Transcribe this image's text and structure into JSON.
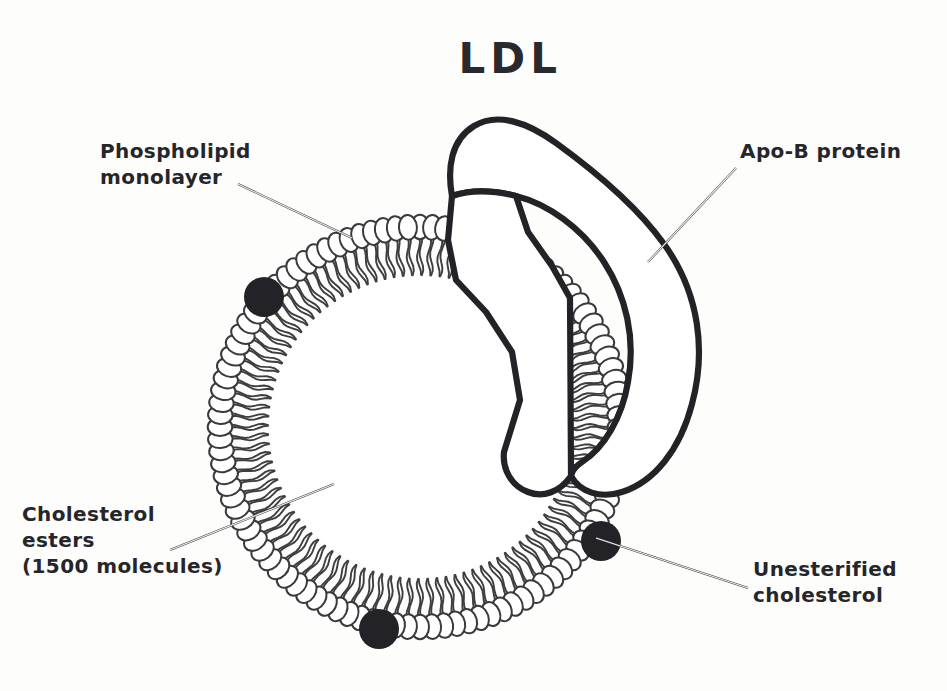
{
  "figure": {
    "title": "LDL",
    "background_color": "#fdfdfc",
    "ink_color": "#232327"
  },
  "labels": {
    "phospholipid": {
      "line1": "Phospholipid",
      "line2": "monolayer",
      "x": 100,
      "y": 143
    },
    "apob": {
      "line1": "Apo-B protein",
      "x": 740,
      "y": 143
    },
    "cholesterol_esters": {
      "line1": "Cholesterol",
      "line2": "esters",
      "line3": "(1500 molecules)",
      "x": 20,
      "y": 505
    },
    "unesterified": {
      "line1": "Unesterified",
      "line2": "cholesterol",
      "x": 753,
      "y": 560
    }
  },
  "structure": {
    "particle_center_x": 420,
    "particle_center_y": 427,
    "head_ring_radius": 200,
    "head_radius": 11,
    "tail_inner_radius": 152,
    "phospholipid_count": 104,
    "core_radius": 150,
    "cholesterol_dots": [
      {
        "name": "unesterified-cholesterol-upper-left",
        "x": 264,
        "y": 297,
        "r": 20
      },
      {
        "name": "unesterified-cholesterol-bottom",
        "x": 379,
        "y": 629,
        "r": 20
      },
      {
        "name": "unesterified-cholesterol-right",
        "x": 601,
        "y": 541,
        "r": 20
      }
    ]
  },
  "leader_lines": {
    "phospholipid": {
      "x1": 238,
      "y1": 184,
      "x2": 352,
      "y2": 238
    },
    "apob": {
      "x1": 736,
      "y1": 168,
      "x2": 648,
      "y2": 262
    },
    "cholesterol_esters": {
      "x1": 170,
      "y1": 550,
      "x2": 334,
      "y2": 484
    },
    "unesterified": {
      "x1": 748,
      "y1": 588,
      "x2": 596,
      "y2": 538
    }
  },
  "colors": {
    "ink": "#232327",
    "head_stroke": "#3a3a3e",
    "tail": "#3e3e42",
    "paper": "#fdfdfc"
  }
}
